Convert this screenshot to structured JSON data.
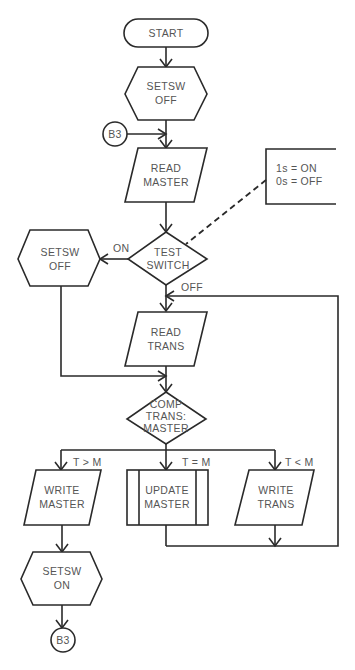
{
  "diagram": {
    "type": "flowchart",
    "nodes": {
      "start": {
        "shape": "terminator",
        "label": "START"
      },
      "setsw_off_1": {
        "shape": "preparation",
        "line1": "SETSW",
        "line2": "OFF"
      },
      "connector_b3_in": {
        "shape": "connector",
        "label": "B3"
      },
      "read_master": {
        "shape": "input-output",
        "line1": "READ",
        "line2": "MASTER"
      },
      "annotation": {
        "shape": "annotation",
        "line1": "1s = ON",
        "line2": "0s = OFF"
      },
      "test_switch": {
        "shape": "decision",
        "line1": "TEST",
        "line2": "SWITCH"
      },
      "setsw_off_2": {
        "shape": "preparation",
        "line1": "SETSW",
        "line2": "OFF"
      },
      "read_trans": {
        "shape": "input-output",
        "line1": "READ",
        "line2": "TRANS"
      },
      "comp": {
        "shape": "decision",
        "line1": "COMP",
        "line2": "TRANS:",
        "line3": "MASTER"
      },
      "write_master": {
        "shape": "input-output",
        "line1": "WRITE",
        "line2": "MASTER"
      },
      "update_master": {
        "shape": "predefined-process",
        "line1": "UPDATE",
        "line2": "MASTER"
      },
      "write_trans": {
        "shape": "input-output",
        "line1": "WRITE",
        "line2": "TRANS"
      },
      "setsw_on": {
        "shape": "preparation",
        "line1": "SETSW",
        "line2": "ON"
      },
      "connector_b3_out": {
        "shape": "connector",
        "label": "B3"
      }
    },
    "edge_labels": {
      "on": "ON",
      "off": "OFF",
      "gt": "T > M",
      "eq": "T = M",
      "lt": "T < M"
    }
  }
}
